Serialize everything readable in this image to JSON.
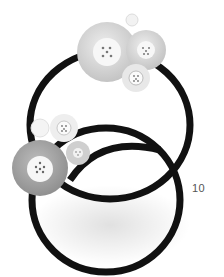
{
  "page": {
    "page_number": "10",
    "background": "#ffffff"
  },
  "photo": {
    "subject": "two black elastic hair ties with decorative flower buttons",
    "ring_color": "#111111",
    "button_color_light": "#d8d8d8",
    "button_color_dark": "#a9a9a9",
    "button_center_color": "#f7f7f7"
  }
}
